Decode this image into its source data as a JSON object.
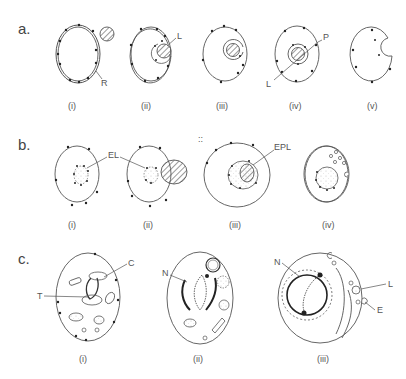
{
  "figure": {
    "rows": [
      {
        "label": "a.",
        "panels": [
          {
            "sub": "(i)",
            "annotations": [
              "R"
            ]
          },
          {
            "sub": "(ii)",
            "annotations": [
              "L"
            ]
          },
          {
            "sub": "(iii)",
            "annotations": []
          },
          {
            "sub": "(iv)",
            "annotations": [
              "P",
              "L"
            ]
          },
          {
            "sub": "(v)",
            "annotations": []
          }
        ]
      },
      {
        "label": "b.",
        "panels": [
          {
            "sub": "(i)",
            "annotations": [
              "EL"
            ]
          },
          {
            "sub": "(ii)",
            "annotations": []
          },
          {
            "sub": "(iii)",
            "annotations": [
              "EPL"
            ]
          },
          {
            "sub": "(iv)",
            "annotations": []
          }
        ]
      },
      {
        "label": "c.",
        "panels": [
          {
            "sub": "(i)",
            "annotations": [
              "C",
              "T"
            ]
          },
          {
            "sub": "(ii)",
            "annotations": [
              "N"
            ]
          },
          {
            "sub": "(iii)",
            "annotations": [
              "N",
              "L",
              "E"
            ]
          }
        ]
      }
    ]
  },
  "colors": {
    "stroke": "#555555",
    "dot": "#222222",
    "stipple": "#bbbbbb"
  }
}
